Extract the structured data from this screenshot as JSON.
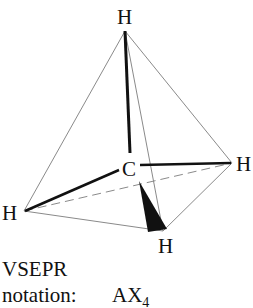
{
  "molecule": {
    "central_atom": "C",
    "ligands": [
      "H",
      "H",
      "H",
      "H"
    ],
    "labels": {
      "top": "H",
      "center": "C",
      "right": "H",
      "left": "H",
      "bottom": "H"
    }
  },
  "caption": {
    "line1": "VSEPR",
    "line2_label": "notation:",
    "notation_base": "AX",
    "notation_subscript": "4"
  },
  "colors": {
    "bond": "#111111",
    "edge": "#888888",
    "text": "#111111"
  }
}
